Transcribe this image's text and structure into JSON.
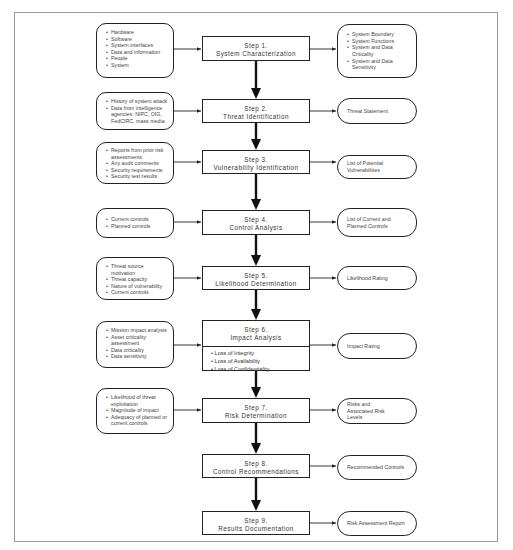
{
  "steps": [
    {
      "num": "Step 1.",
      "title": "System Characterization"
    },
    {
      "num": "Step 2.",
      "title": "Threat Identification"
    },
    {
      "num": "Step 3.",
      "title": "Vulnerability Identification"
    },
    {
      "num": "Step 4.",
      "title": "Control Analysis"
    },
    {
      "num": "Step 5.",
      "title": "Likelihood Determination"
    },
    {
      "num": "Step 6.",
      "title": "Impact Analysis",
      "items": [
        "Loss of Integrity",
        "Loss of Availability",
        "Loss of Confidentiality"
      ]
    },
    {
      "num": "Step 7.",
      "title": "Risk Determination"
    },
    {
      "num": "Step 8.",
      "title": "Control Recommendations"
    },
    {
      "num": "Step 9.",
      "title": "Results Documentation"
    }
  ],
  "inputs": [
    [
      "Hardware",
      "Software",
      "System interfaces",
      "Data and information",
      "People",
      "System"
    ],
    [
      "History of system attack",
      "Data from intelligence agencies: NIPC, OIG, FedCIRC, mass media"
    ],
    [
      "Reports from prior risk assessments",
      "Any audit comments",
      "Security requirements",
      "Security test results"
    ],
    [
      "Current controls",
      "Planned controls"
    ],
    [
      "Threat source motivation",
      "Threat capacity",
      "Nature of vulnerability",
      "Current controls"
    ],
    [
      "Mission impact analysis",
      "Asset criticality assessment",
      "Data criticality",
      "Data sensitivity"
    ],
    [
      "Likelihood of threat exploitation",
      "Magnitude of impact",
      "Adequacy of planned or current controls"
    ]
  ],
  "outputs": [
    {
      "bullets": [
        "System Boundary",
        "System Functions",
        "System and Data Criticality",
        "System and Data Sensitivity"
      ]
    },
    {
      "text": "Threat Statement"
    },
    {
      "text": "List of Potential Vulnerabilities"
    },
    {
      "text": "List of Current and Planned Controls"
    },
    {
      "text": "Likelihood Rating"
    },
    {
      "text": "Impact Rating"
    },
    {
      "text": "Risks and Associated Risk Levels"
    },
    {
      "text": "Recommended Controls"
    },
    {
      "text": "Risk Assessment Report"
    }
  ]
}
